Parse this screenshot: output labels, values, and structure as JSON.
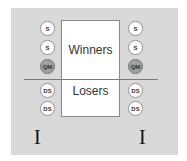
{
  "diagram": {
    "center": {
      "top_label": "Winners",
      "bottom_label": "Losers"
    },
    "left_column": {
      "nodes": [
        {
          "label": "S",
          "type": "plain"
        },
        {
          "label": "S",
          "type": "plain"
        },
        {
          "label": "QM",
          "type": "highlighted"
        },
        {
          "label": "DS",
          "type": "plain"
        },
        {
          "label": "DS",
          "type": "plain"
        }
      ],
      "marker": "I"
    },
    "right_column": {
      "nodes": [
        {
          "label": "S",
          "type": "plain"
        },
        {
          "label": "S",
          "type": "plain"
        },
        {
          "label": "QM",
          "type": "highlighted"
        },
        {
          "label": "DS",
          "type": "plain"
        },
        {
          "label": "DS",
          "type": "plain"
        }
      ],
      "marker": "I"
    },
    "colors": {
      "panel": "#d9d9d9",
      "node_fill": "#ffffff",
      "highlight_fill": "#a0a0a0",
      "divider": "#7a7a7a"
    }
  }
}
